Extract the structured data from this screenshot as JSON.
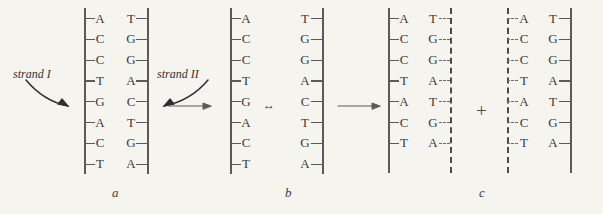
{
  "figure": {
    "background_color": "#f6f4ef",
    "ink_color": "#3b3b3b"
  },
  "panels": [
    {
      "id": "a",
      "caption": "a",
      "description": "intact parental DNA double helix",
      "type": "duplex",
      "left_strand": [
        "A",
        "C",
        "C",
        "T",
        "G",
        "A",
        "C",
        "T"
      ],
      "right_strand": [
        "T",
        "G",
        "G",
        "A",
        "C",
        "T",
        "G",
        "A"
      ]
    },
    {
      "id": "b",
      "caption": "b",
      "description": "separated parental strands",
      "type": "separated",
      "left_strand": [
        "A",
        "C",
        "C",
        "T",
        "G",
        "A",
        "C",
        "T"
      ],
      "right_strand": [
        "T",
        "G",
        "G",
        "A",
        "C",
        "T",
        "G",
        "A"
      ]
    },
    {
      "id": "c",
      "caption": "c",
      "description": "two daughter duplexes each with one new strand",
      "type": "two_duplexes",
      "duplex_one": {
        "left_strand": [
          "A",
          "C",
          "C",
          "T",
          "A",
          "C",
          "T"
        ],
        "right_strand": [
          "T",
          "G",
          "G",
          "A",
          "T",
          "G",
          "A"
        ]
      },
      "duplex_two": {
        "left_strand": [
          "A",
          "C",
          "C",
          "T",
          "A",
          "C",
          "T"
        ],
        "right_strand": [
          "T",
          "G",
          "G",
          "A",
          "T",
          "G",
          "A"
        ]
      }
    }
  ],
  "annotations": {
    "strand_one_label": "strand I",
    "strand_two_label": "strand II",
    "plus_symbol": "+",
    "equilibrium_symbol": "↔"
  },
  "arrows": [
    {
      "name": "strand-one-pointer",
      "kind": "curved",
      "direction": "down-right"
    },
    {
      "name": "strand-two-pointer",
      "kind": "curved",
      "direction": "down-left"
    },
    {
      "name": "a-to-b-arrow",
      "kind": "straight",
      "direction": "right"
    },
    {
      "name": "b-separation-arrow",
      "kind": "double",
      "direction": "horizontal"
    },
    {
      "name": "b-to-c-arrow",
      "kind": "straight",
      "direction": "right"
    }
  ]
}
